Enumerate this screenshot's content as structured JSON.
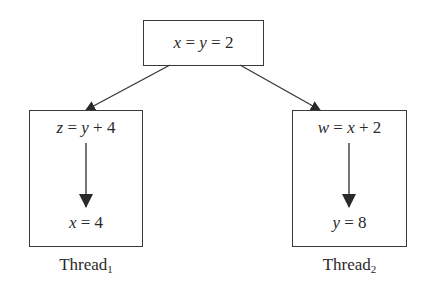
{
  "diagram": {
    "root": {
      "expression": "x = y = 2",
      "parts": [
        {
          "t": "x",
          "italic": true
        },
        {
          "t": " = ",
          "italic": false
        },
        {
          "t": "y",
          "italic": true
        },
        {
          "t": " = ",
          "italic": false
        },
        {
          "t": "2",
          "italic": false
        }
      ]
    },
    "threads": [
      {
        "label": "Thread",
        "subscript": "1",
        "statements": [
          {
            "expression": "z = y + 4",
            "parts": [
              {
                "t": "z",
                "italic": true
              },
              {
                "t": " = ",
                "italic": false
              },
              {
                "t": "y",
                "italic": true
              },
              {
                "t": " + ",
                "italic": false
              },
              {
                "t": "4",
                "italic": false
              }
            ]
          },
          {
            "expression": "x = 4",
            "parts": [
              {
                "t": "x",
                "italic": true
              },
              {
                "t": " = ",
                "italic": false
              },
              {
                "t": "4",
                "italic": false
              }
            ]
          }
        ]
      },
      {
        "label": "Thread",
        "subscript": "2",
        "statements": [
          {
            "expression": "w = x + 2",
            "parts": [
              {
                "t": "w",
                "italic": true
              },
              {
                "t": " = ",
                "italic": false
              },
              {
                "t": "x",
                "italic": true
              },
              {
                "t": " + ",
                "italic": false
              },
              {
                "t": "2",
                "italic": false
              }
            ]
          },
          {
            "expression": "y = 8",
            "parts": [
              {
                "t": "y",
                "italic": true
              },
              {
                "t": " = ",
                "italic": false
              },
              {
                "t": "8",
                "italic": false
              }
            ]
          }
        ]
      }
    ],
    "edges": [
      {
        "from": "root",
        "to": "thread-1",
        "type": "arrow"
      },
      {
        "from": "root",
        "to": "thread-2",
        "type": "arrow"
      },
      {
        "from": "thread-1.statement-1",
        "to": "thread-1.statement-2",
        "type": "arrow"
      },
      {
        "from": "thread-2.statement-1",
        "to": "thread-2.statement-2",
        "type": "arrow"
      }
    ],
    "colors": {
      "stroke": "#3a3a3a",
      "text": "#2a2a2a",
      "background": "#ffffff"
    }
  }
}
